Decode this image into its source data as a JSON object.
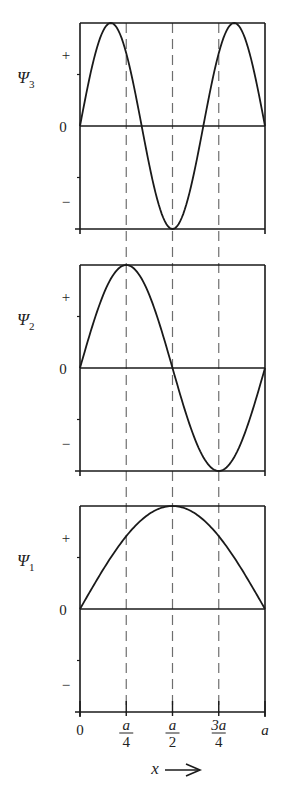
{
  "chart_data": {
    "type": "line",
    "title": "",
    "xlabel": "x",
    "x_range": [
      0,
      1
    ],
    "x_unit": "a",
    "x_ticks": [
      {
        "value": 0,
        "label": "0"
      },
      {
        "value": 0.25,
        "label_num": "a",
        "label_den": "4"
      },
      {
        "value": 0.5,
        "label_num": "a",
        "label_den": "2"
      },
      {
        "value": 0.75,
        "label_num": "3a",
        "label_den": "4"
      },
      {
        "value": 1,
        "label": "a"
      }
    ],
    "reference_lines_x": [
      0.25,
      0.5,
      0.75
    ],
    "panels": [
      {
        "name": "Psi3",
        "label": "Ψ",
        "subscript": "3",
        "n": 3,
        "ylim": [
          -1,
          1
        ],
        "y_ticks": [
          "+",
          "0",
          "−"
        ]
      },
      {
        "name": "Psi2",
        "label": "Ψ",
        "subscript": "2",
        "n": 2,
        "ylim": [
          -1,
          1
        ],
        "y_ticks": [
          "+",
          "0",
          "−"
        ]
      },
      {
        "name": "Psi1",
        "label": "Ψ",
        "subscript": "1",
        "n": 1,
        "ylim": [
          -1,
          1
        ],
        "y_ticks": [
          "+",
          "0",
          "−"
        ]
      }
    ],
    "samples": 120
  },
  "axis": {
    "x_label": "x",
    "arrow": "→"
  }
}
